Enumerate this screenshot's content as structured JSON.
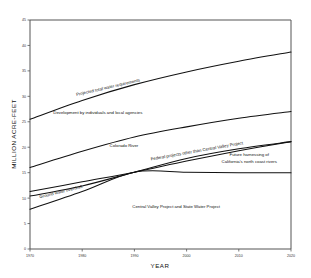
{
  "chart_data": {
    "type": "line",
    "title": "",
    "xlabel": "YEAR",
    "ylabel": "MILLION ACRE-FEET",
    "xlim": [
      1970,
      2020
    ],
    "ylim": [
      0,
      45
    ],
    "xticks": [
      1970,
      1980,
      1990,
      2000,
      2010,
      2020
    ],
    "yticks": [
      0,
      5,
      10,
      15,
      20,
      25,
      30,
      35,
      40,
      45
    ],
    "grid": false,
    "legend_position": "inline-annotations",
    "x": [
      1970,
      1980,
      1990,
      2000,
      2010,
      2020
    ],
    "series": [
      {
        "name": "Projected total water requirements",
        "values": [
          25.5,
          29.2,
          32.3,
          34.8,
          36.9,
          38.7
        ]
      },
      {
        "name": "Development by individuals and local agencies (upper bound)",
        "values": [
          16.0,
          19.2,
          22.0,
          24.0,
          25.7,
          27.0
        ]
      },
      {
        "name": "Colorado River (upper bound)",
        "values": [
          11.3,
          13.2,
          15.1,
          17.3,
          19.3,
          21.1
        ]
      },
      {
        "name": "Federal projects other than Central Valley Project (upper bound)",
        "values": [
          10.4,
          12.4,
          15.1,
          17.8,
          19.7,
          21.1
        ]
      },
      {
        "name": "Ground water overdraft / Central Valley Project and State Water Project (upper bound)",
        "values": [
          7.8,
          11.3,
          15.1,
          15.1,
          15.0,
          15.0
        ]
      }
    ],
    "annotations": [
      {
        "text": "Projected total water requirements",
        "x": 1985,
        "y": 31.5,
        "rotation": -13
      },
      {
        "text": "Development by individuals and local agencies",
        "x": 1983,
        "y": 26.5,
        "rotation": 0
      },
      {
        "text": "Colorado River",
        "x": 1988,
        "y": 20.0,
        "rotation": 0
      },
      {
        "text": "Federal projects other than Central Valley Project",
        "x": 2002,
        "y": 19.0,
        "rotation": -10
      },
      {
        "text": "Future harnessing of",
        "x": 2012,
        "y": 18.2,
        "rotation": 0
      },
      {
        "text": "California's north coast rivers",
        "x": 2012,
        "y": 16.9,
        "rotation": 0
      },
      {
        "text": "Ground water overdraft",
        "x": 1976,
        "y": 11.0,
        "rotation": -14
      },
      {
        "text": "Central Valley Project and State Water Project",
        "x": 1998,
        "y": 8.0,
        "rotation": 0
      }
    ]
  },
  "axes": {
    "x_title": "YEAR",
    "y_title": "MILLION ACRE-FEET",
    "x_tick_labels": [
      "1970",
      "1980",
      "1990",
      "2000",
      "2010",
      "2020"
    ],
    "y_tick_labels": [
      "0",
      "5",
      "10",
      "15",
      "20",
      "25",
      "30",
      "35",
      "40",
      "45"
    ]
  },
  "labels": {
    "projected_total": "Projected total water requirements",
    "development_local": "Development by individuals and local agencies",
    "colorado_river": "Colorado River",
    "federal_projects": "Federal projects other than Central Valley Project",
    "future_harnessing_1": "Future harnessing of",
    "future_harnessing_2": "California's north coast rivers",
    "ground_water": "Ground water overdraft",
    "cvp_swp": "Central Valley Project and State Water Project"
  },
  "colors": {
    "curve": "#111111",
    "axis": "#555555",
    "background": "#ffffff",
    "text": "#111111"
  }
}
